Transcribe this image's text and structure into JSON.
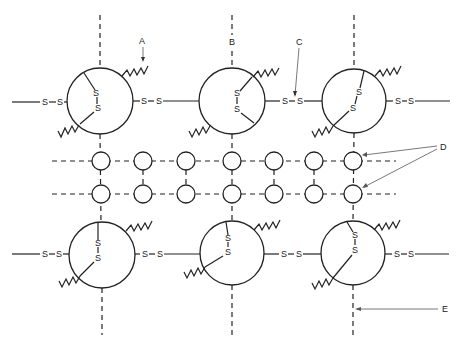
{
  "diagram": {
    "type": "schematic-lattice",
    "labels": {
      "A": "A",
      "B": "B",
      "C": "C",
      "D": "D",
      "E": "E"
    },
    "bond_symbol": "S",
    "large_units": [
      {
        "id": "top-left",
        "cx": 100,
        "cy": 101,
        "r": 33
      },
      {
        "id": "top-middle",
        "cx": 232,
        "cy": 101,
        "r": 33
      },
      {
        "id": "top-right",
        "cx": 354,
        "cy": 101,
        "r": 32
      },
      {
        "id": "bottom-left",
        "cx": 102,
        "cy": 255,
        "r": 33
      },
      {
        "id": "bottom-middle",
        "cx": 232,
        "cy": 253,
        "r": 32
      },
      {
        "id": "bottom-right",
        "cx": 353,
        "cy": 253,
        "r": 32
      }
    ],
    "small_node_columns": [
      101,
      143,
      186,
      232,
      274,
      314,
      353
    ],
    "small_node_rows": [
      161,
      194
    ],
    "small_node_radius": 9,
    "colors": {
      "ink": "#222222",
      "background": "#ffffff",
      "arrow": "#555555"
    }
  }
}
